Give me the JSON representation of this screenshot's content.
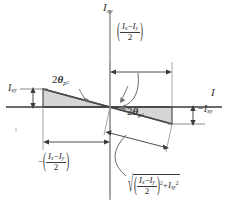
{
  "figure": {
    "type": "mohrs-circle-moment-of-inertia-diagram",
    "axes": {
      "vertical_label": "I",
      "vertical_label_sub": "xy",
      "horizontal_label": "I"
    },
    "labels": {
      "ixy_left": {
        "base": "I",
        "sub": "xy"
      },
      "neg_ixy_right": {
        "sign": "−",
        "base": "I",
        "sub": "xy"
      },
      "theta_p2": {
        "coef": "2",
        "greek": "θ",
        "sub": "p",
        "subsub": "2"
      },
      "theta_p1": {
        "coef": "2",
        "greek": "θ",
        "sub": "p",
        "subsub": "1"
      },
      "top_dimension": {
        "open_paren": "(",
        "close_paren": ")",
        "numerator_a": "I",
        "numerator_a_sub": "x",
        "minus": "−",
        "numerator_b": "I",
        "numerator_b_sub": "y",
        "denominator": "2"
      },
      "bottom_left_dimension": {
        "leading_minus": "−",
        "open_paren": "(",
        "close_paren": ")",
        "numerator_a": "I",
        "numerator_a_sub": "x",
        "minus": "−",
        "numerator_b": "I",
        "numerator_b_sub": "y",
        "denominator": "2"
      },
      "radius_expression": {
        "radical": "√",
        "open_paren": "(",
        "close_paren": ")",
        "numerator_a": "I",
        "numerator_a_sub": "x",
        "minus": "−",
        "numerator_b": "I",
        "numerator_b_sub": "y",
        "denominator": "2",
        "exponent": "2",
        "plus": "+",
        "term2": "I",
        "term2_sub": "xy",
        "term2_sup": "2"
      }
    },
    "colors": {
      "stroke": "#3a3a3a",
      "thin": "#8c8c8c",
      "fill": "#d6d6d6",
      "edge": "#5a5a5a",
      "background": "#ffffff"
    },
    "geometry": {
      "origin": {
        "x": 110,
        "y": 107
      },
      "x_axis_end": 222,
      "y_axis_top": 10,
      "left_triangle": {
        "x_left": 43,
        "top_y": 89
      },
      "right_triangle": {
        "x_right": 172,
        "bottom_y": 124
      }
    }
  }
}
